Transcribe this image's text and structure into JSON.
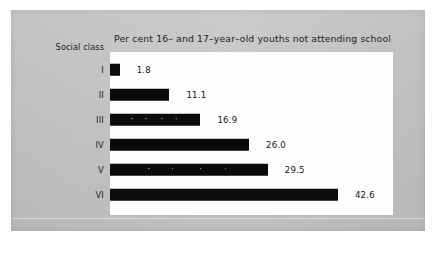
{
  "chart_data": {
    "type": "bar",
    "orientation": "horizontal",
    "title": "Per cent 16– and 17–year–old youths not attending school",
    "xlabel": "",
    "ylabel": "Social class",
    "categories": [
      "I",
      "II",
      "III",
      "IV",
      "V",
      "VI"
    ],
    "values": [
      1.8,
      11.1,
      16.9,
      26.0,
      29.5,
      42.6
    ],
    "value_labels": [
      "1.8",
      "11.1",
      "16.9",
      "26.0",
      "29.5",
      "42.6"
    ],
    "xlim": [
      0,
      52.9
    ],
    "grid": false,
    "legend": null,
    "bar_color": "#0b0b0b",
    "plot_background": "#fdfdfd",
    "page_background": "#c4c4c4"
  },
  "axis": {
    "category_caption": "Social class"
  }
}
